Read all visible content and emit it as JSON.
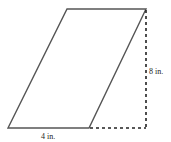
{
  "diagram": {
    "shape": "parallelogram",
    "colors": {
      "outline": "#555555",
      "dashed": "#222222",
      "text": "#222222",
      "background": "#ffffff"
    },
    "labels": {
      "base": "4 in.",
      "height": "8 in."
    }
  }
}
